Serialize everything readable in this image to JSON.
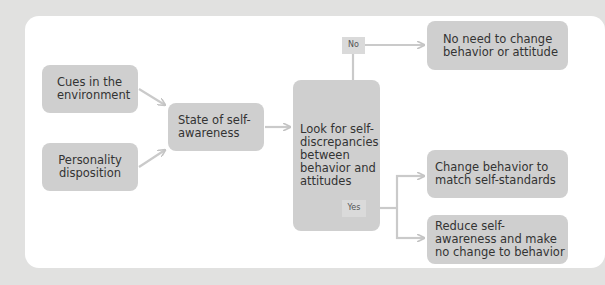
{
  "diagram": {
    "nodes": {
      "cues": "Cues in the environment",
      "personality": "Personality disposition",
      "state": "State of self-awareness",
      "look": "Look for self-discrepancies between behavior and attitudes",
      "no_need": "No need to change behavior or attitude",
      "change": "Change behavior to match self-standards",
      "reduce": "Reduce self-awareness and make no change to behavior"
    },
    "branch_labels": {
      "no": "No",
      "yes": "Yes"
    },
    "edges": [
      {
        "from": "cues",
        "to": "state"
      },
      {
        "from": "personality",
        "to": "state"
      },
      {
        "from": "state",
        "to": "look"
      },
      {
        "from": "look",
        "to": "no_need",
        "label": "No"
      },
      {
        "from": "look",
        "to": "change",
        "label": "Yes"
      },
      {
        "from": "look",
        "to": "reduce",
        "label": "Yes"
      }
    ],
    "colors": {
      "background": "#e1e1e0",
      "panel": "#ffffff",
      "box": "#cfcfcf",
      "line": "#c8c8c8",
      "text": "#333333"
    }
  }
}
